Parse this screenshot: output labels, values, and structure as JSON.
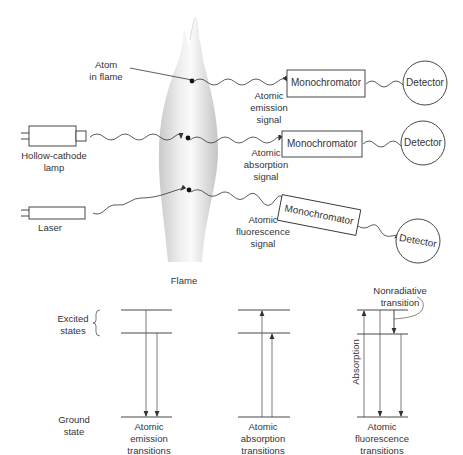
{
  "figure": {
    "flame_label": "Flame",
    "atom_label": [
      "Atom",
      "in flame"
    ],
    "sources": {
      "hollow_cathode": [
        "Hollow-cathode",
        "lamp"
      ],
      "laser": "Laser"
    },
    "signals": {
      "emission": [
        "Atomic",
        "emission",
        "signal"
      ],
      "absorption": [
        "Atomic",
        "absorption",
        "signal"
      ],
      "fluorescence": [
        "Atomic",
        "fluorescence",
        "signal"
      ]
    },
    "monochromator_label": "Monochromator",
    "detector_label": "Detector"
  },
  "energy_levels": {
    "excited_label": [
      "Excited",
      "states"
    ],
    "ground_label": [
      "Ground",
      "state"
    ],
    "nonradiative_label": [
      "Nonradiative",
      "transition"
    ],
    "absorption_axis_label": "Absorption",
    "panels": [
      {
        "caption": [
          "Atomic",
          "emission",
          "transitions"
        ]
      },
      {
        "caption": [
          "Atomic",
          "absorption",
          "transitions"
        ]
      },
      {
        "caption": [
          "Atomic",
          "fluorescence",
          "transitions"
        ]
      }
    ]
  },
  "colors": {
    "line": "#333333",
    "flame_light": "#f4f4f4",
    "flame_dark": "#c8c8c8"
  }
}
